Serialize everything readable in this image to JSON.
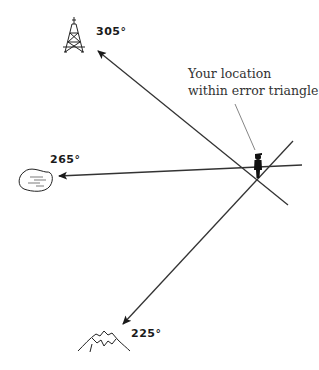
{
  "diagram": {
    "type": "triangulation-error-triangle",
    "caption": {
      "line1": "Your location",
      "line2": "within error triangle"
    },
    "bearings": [
      {
        "label": "305°",
        "landmark": "radio-tower",
        "icon": "tower-icon"
      },
      {
        "label": "265°",
        "landmark": "lake",
        "icon": "lake-icon"
      },
      {
        "label": "225°",
        "landmark": "mountain",
        "icon": "mountain-icon"
      }
    ],
    "user_marker": {
      "icon": "person-icon"
    },
    "colors": {
      "line": "#333333",
      "ink": "#1a1a1a",
      "background": "#ffffff"
    }
  }
}
